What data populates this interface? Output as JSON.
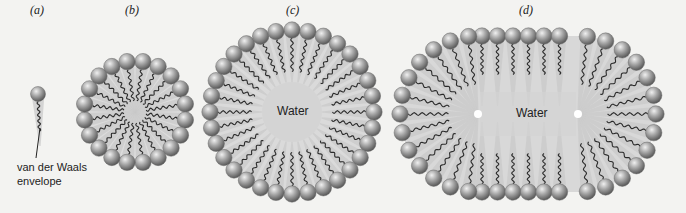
{
  "figure": {
    "panels": [
      {
        "id": "a",
        "label": "(a)",
        "type": "single-lipid",
        "annotation": "van der Waals\nenvelope",
        "annotation_line1": "van der Waals",
        "annotation_line2": "envelope"
      },
      {
        "id": "b",
        "label": "(b)",
        "type": "spherical-micelle",
        "head_count": 20
      },
      {
        "id": "c",
        "label": "(c)",
        "type": "spherical-bilayer-vesicle",
        "head_count": 32,
        "center_label": "Water"
      },
      {
        "id": "d",
        "label": "(d)",
        "type": "elongated-vesicle",
        "head_count": 44,
        "center_label": "Water"
      }
    ],
    "colors": {
      "background": "#f3f3f1",
      "head": "#9a9a9a",
      "head_highlight": "#e6e6e6",
      "head_shadow": "#5a5a5a",
      "tail": "#2a2a2a",
      "envelope": "#c9c9c9",
      "water": "#d4d4d4"
    }
  }
}
